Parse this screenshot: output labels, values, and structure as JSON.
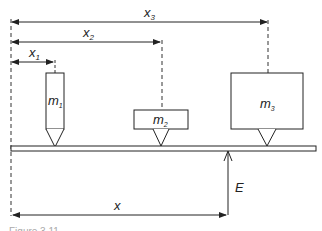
{
  "diagram": {
    "type": "physics-moment-diagram",
    "labels": {
      "x1": {
        "main": "x",
        "sub": "1"
      },
      "x2": {
        "main": "x",
        "sub": "2"
      },
      "x3": {
        "main": "x",
        "sub": "3"
      },
      "m1": {
        "main": "m",
        "sub": "1"
      },
      "m2": {
        "main": "m",
        "sub": "2"
      },
      "m3": {
        "main": "m",
        "sub": "3"
      },
      "x": "x",
      "E": "E"
    },
    "caption": "Figure 3.11",
    "colors": {
      "line": "#222222",
      "background": "#ffffff"
    }
  }
}
